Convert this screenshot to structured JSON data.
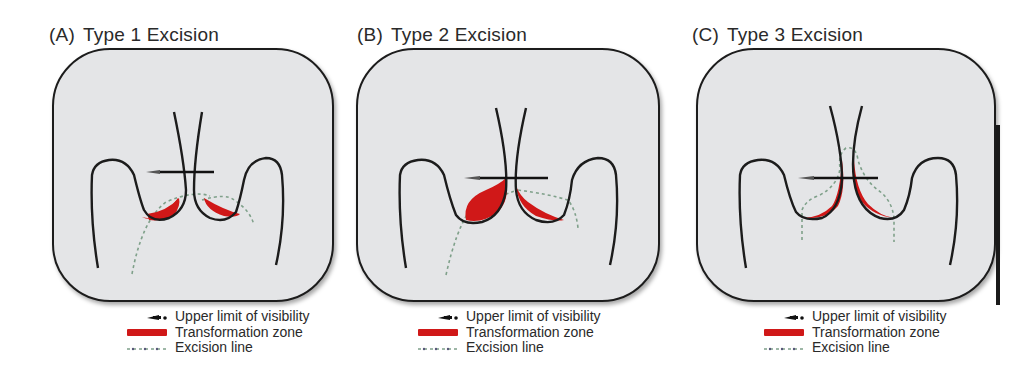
{
  "figure": {
    "panels": [
      {
        "id": "A",
        "label": "(A)",
        "title": "Type 1 Excision",
        "description": "Transformation zone fully ectocervical; small shallow excision"
      },
      {
        "id": "B",
        "label": "(B)",
        "title": "Type 2 Excision",
        "description": "Transformation zone partly endocervical but fully visible; larger excision"
      },
      {
        "id": "C",
        "label": "(C)",
        "title": "Type 3 Excision",
        "description": "Transformation zone extends into canal beyond visibility; deep cone excision"
      }
    ],
    "legend": {
      "upper_limit": "Upper  limit of visibility",
      "transformation_zone": "Transformation zone",
      "excision_line": "Excision line"
    },
    "colors": {
      "background": "#e4e5e7",
      "outline": "#1c1c1c",
      "transformation_zone": "#d01818",
      "excision_line": "#7fa08a"
    }
  }
}
